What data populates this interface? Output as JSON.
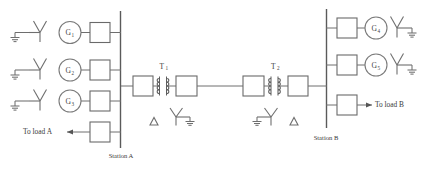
{
  "diagram": {
    "kind": "power-system-single-line-diagram",
    "width": 435,
    "height": 170,
    "background": "#ffffff",
    "line_color": "#6e6e6e",
    "text_color": "#3a3a3a"
  },
  "stations": [
    {
      "id": "station-a",
      "label": "Station A"
    },
    {
      "id": "station-b",
      "label": "Station B"
    }
  ],
  "generators": [
    {
      "id": "g1",
      "label": "G",
      "subscript": "1",
      "station": "station-a"
    },
    {
      "id": "g2",
      "label": "G",
      "subscript": "2",
      "station": "station-a"
    },
    {
      "id": "g3",
      "label": "G",
      "subscript": "3",
      "station": "station-a"
    },
    {
      "id": "g4",
      "label": "G",
      "subscript": "4",
      "station": "station-b"
    },
    {
      "id": "g5",
      "label": "G",
      "subscript": "5",
      "station": "station-b"
    }
  ],
  "transformers": [
    {
      "id": "t1",
      "label": "T",
      "subscript": "1"
    },
    {
      "id": "t2",
      "label": "T",
      "subscript": "2"
    }
  ],
  "loads": [
    {
      "id": "load-a",
      "label": "To load A",
      "station": "station-a",
      "arrow": "left"
    },
    {
      "id": "load-b",
      "label": "To load B",
      "station": "station-b",
      "arrow": "right"
    }
  ],
  "winding_symbols": [
    {
      "id": "t1-delta",
      "type": "delta"
    },
    {
      "id": "t1-wye-grounded",
      "type": "wye-grounded"
    },
    {
      "id": "t2-wye-grounded",
      "type": "wye-grounded"
    },
    {
      "id": "t2-delta",
      "type": "delta"
    }
  ],
  "icons": {
    "generator": "generator-circle-icon",
    "breaker": "circuit-breaker-icon",
    "transformer": "transformer-winding-icon",
    "ground": "ground-icon",
    "wye": "wye-winding-icon",
    "delta": "delta-winding-icon",
    "bus": "busbar-icon",
    "arrow": "arrow-icon"
  }
}
